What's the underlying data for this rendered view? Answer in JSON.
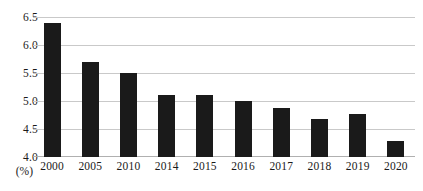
{
  "chart_data": {
    "type": "bar",
    "title": "",
    "xlabel": "",
    "ylabel": "(%)",
    "categories": [
      "2000",
      "2005",
      "2010",
      "2014",
      "2015",
      "2016",
      "2017",
      "2018",
      "2019",
      "2020"
    ],
    "values": [
      6.4,
      5.7,
      5.5,
      5.1,
      5.1,
      5.0,
      4.88,
      4.68,
      4.77,
      4.28
    ],
    "ylim": [
      4.0,
      6.5
    ],
    "ytick_labels": [
      "6.5",
      "6.0",
      "5.5",
      "5.0",
      "4.5",
      "4.0"
    ],
    "ytick_values": [
      6.5,
      6.0,
      5.5,
      5.0,
      4.5,
      4.0
    ],
    "grid": true,
    "legend": "none",
    "bar_color": "#1a1a1a",
    "gridline_color": "#c9c9c9",
    "background_color": "#ffffff",
    "unit_note": "(%)"
  }
}
